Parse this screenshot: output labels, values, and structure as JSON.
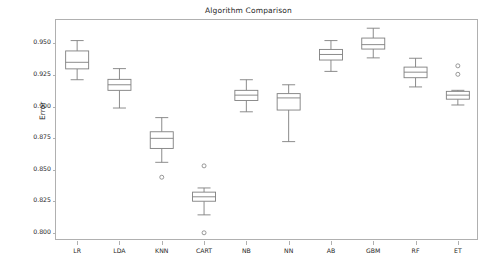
{
  "chart_data": {
    "type": "box",
    "title": "Algorithm Comparison",
    "xlabel": "",
    "ylabel": "Error",
    "grid": false,
    "legend": false,
    "ylim": [
      0.7935,
      0.9685
    ],
    "yticks": [
      0.8,
      0.825,
      0.85,
      0.875,
      0.9,
      0.925,
      0.95
    ],
    "ytick_labels": [
      "0.800",
      "0.825",
      "0.850",
      "0.875",
      "0.900",
      "0.925",
      "0.950"
    ],
    "categories": [
      "LR",
      "LDA",
      "KNN",
      "CART",
      "NB",
      "NN",
      "AB",
      "GBM",
      "RF",
      "ET"
    ],
    "boxes": [
      {
        "name": "LR",
        "whisker_low": 0.9212,
        "q1": 0.9298,
        "median": 0.935,
        "q3": 0.944,
        "whisker_high": 0.9522,
        "outliers": []
      },
      {
        "name": "LDA",
        "whisker_low": 0.8988,
        "q1": 0.9128,
        "median": 0.9172,
        "q3": 0.9215,
        "whisker_high": 0.93,
        "outliers": []
      },
      {
        "name": "KNN",
        "whisker_low": 0.8558,
        "q1": 0.8668,
        "median": 0.8748,
        "q3": 0.88,
        "whisker_high": 0.8912,
        "outliers": [
          0.844
        ]
      },
      {
        "name": "CART",
        "whisker_low": 0.8142,
        "q1": 0.825,
        "median": 0.8285,
        "q3": 0.8322,
        "whisker_high": 0.8355,
        "outliers": [
          0.853,
          0.8
        ]
      },
      {
        "name": "NB",
        "whisker_low": 0.8958,
        "q1": 0.9048,
        "median": 0.909,
        "q3": 0.9128,
        "whisker_high": 0.9212,
        "outliers": []
      },
      {
        "name": "NN",
        "whisker_low": 0.8722,
        "q1": 0.8972,
        "median": 0.9068,
        "q3": 0.9102,
        "whisker_high": 0.9172,
        "outliers": []
      },
      {
        "name": "AB",
        "whisker_low": 0.9278,
        "q1": 0.9368,
        "median": 0.9412,
        "q3": 0.9452,
        "whisker_high": 0.9522,
        "outliers": []
      },
      {
        "name": "GBM",
        "whisker_low": 0.9385,
        "q1": 0.9455,
        "median": 0.949,
        "q3": 0.9542,
        "whisker_high": 0.962,
        "outliers": []
      },
      {
        "name": "RF",
        "whisker_low": 0.9155,
        "q1": 0.9228,
        "median": 0.9272,
        "q3": 0.9312,
        "whisker_high": 0.9382,
        "outliers": []
      },
      {
        "name": "ET",
        "whisker_low": 0.9012,
        "q1": 0.9058,
        "median": 0.909,
        "q3": 0.912,
        "whisker_high": 0.9128,
        "outliers": [
          0.9322,
          0.9255
        ]
      }
    ]
  },
  "colors": {
    "box_stroke": "#7f7f7f",
    "box_fill": "#ffffff",
    "axis": "#b0b0b0",
    "text": "#262626",
    "background": "#ffffff"
  }
}
